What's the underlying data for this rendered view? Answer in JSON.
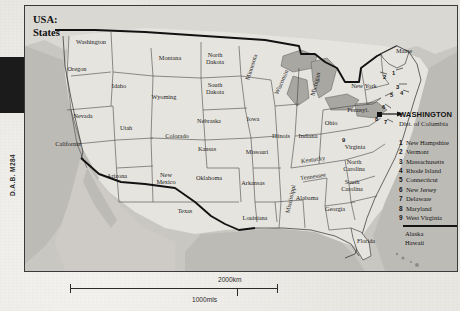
{
  "title": {
    "line1": "USA:",
    "line2": "States"
  },
  "reference_code": "D.A.B. M284",
  "capital": {
    "name": "WASHINGTON",
    "subtitle": "Dist. of Columbia"
  },
  "legend": {
    "entries": [
      {
        "num": "1",
        "name": "New Hampshire"
      },
      {
        "num": "2",
        "name": "Vermont"
      },
      {
        "num": "3",
        "name": "Massachusetts"
      },
      {
        "num": "4",
        "name": "Rhode Island"
      },
      {
        "num": "5",
        "name": "Connecticut"
      },
      {
        "num": "6",
        "name": "New Jersey"
      },
      {
        "num": "7",
        "name": "Delaware"
      },
      {
        "num": "8",
        "name": "Maryland"
      },
      {
        "num": "9",
        "name": "West Virginia"
      }
    ],
    "non_contiguous": [
      "Alaska",
      "Hawaii"
    ]
  },
  "scale": {
    "km": "2000km",
    "miles": "1000mls"
  },
  "map_labels": [
    {
      "name": "Washington",
      "x": 66,
      "y": 36,
      "rot": 0
    },
    {
      "name": "Oregon",
      "x": 52,
      "y": 63,
      "rot": 0
    },
    {
      "name": "Idaho",
      "x": 94,
      "y": 80,
      "rot": 0
    },
    {
      "name": "Montana",
      "x": 145,
      "y": 52,
      "rot": 0
    },
    {
      "name": "Wyoming",
      "x": 139,
      "y": 91,
      "rot": 0
    },
    {
      "name": "Nevada",
      "x": 58,
      "y": 110,
      "rot": 0
    },
    {
      "name": "Utah",
      "x": 101,
      "y": 122,
      "rot": 0
    },
    {
      "name": "Colorado",
      "x": 152,
      "y": 130,
      "rot": 0
    },
    {
      "name": "California",
      "x": 43,
      "y": 138,
      "rot": 0
    },
    {
      "name": "Arizona",
      "x": 92,
      "y": 170,
      "rot": 0
    },
    {
      "name": "New Mexico",
      "x": 141,
      "y": 173,
      "rot": 0
    },
    {
      "name": "Texas",
      "x": 160,
      "y": 205,
      "rot": 0
    },
    {
      "name": "Oklahoma",
      "x": 184,
      "y": 172,
      "rot": 0
    },
    {
      "name": "Kansas",
      "x": 182,
      "y": 143,
      "rot": 0
    },
    {
      "name": "Nebraska",
      "x": 184,
      "y": 115,
      "rot": 0
    },
    {
      "name": "North Dakota",
      "x": 190,
      "y": 53,
      "rot": 0
    },
    {
      "name": "South Dakota",
      "x": 190,
      "y": 83,
      "rot": 0
    },
    {
      "name": "Minnesota",
      "x": 226,
      "y": 61,
      "rot": -72
    },
    {
      "name": "Iowa",
      "x": 228,
      "y": 113,
      "rot": 0
    },
    {
      "name": "Missouri",
      "x": 232,
      "y": 146,
      "rot": 0
    },
    {
      "name": "Arkansas",
      "x": 228,
      "y": 177,
      "rot": 0
    },
    {
      "name": "Louisiana",
      "x": 230,
      "y": 212,
      "rot": 0
    },
    {
      "name": "Wisconsin",
      "x": 256,
      "y": 76,
      "rot": -66
    },
    {
      "name": "Illinois",
      "x": 256,
      "y": 130,
      "rot": 0
    },
    {
      "name": "Michigan",
      "x": 290,
      "y": 78,
      "rot": -76
    },
    {
      "name": "Indiana",
      "x": 283,
      "y": 130,
      "rot": 0
    },
    {
      "name": "Ohio",
      "x": 306,
      "y": 117,
      "rot": 0
    },
    {
      "name": "Kentucky",
      "x": 288,
      "y": 153,
      "rot": -8
    },
    {
      "name": "Tennessee",
      "x": 288,
      "y": 170,
      "rot": -8
    },
    {
      "name": "Mississippi",
      "x": 265,
      "y": 193,
      "rot": -78
    },
    {
      "name": "Alabama",
      "x": 282,
      "y": 192,
      "rot": 0
    },
    {
      "name": "Georgia",
      "x": 310,
      "y": 203,
      "rot": 0
    },
    {
      "name": "Florida",
      "x": 341,
      "y": 235,
      "rot": 0
    },
    {
      "name": "South Carolina",
      "x": 327,
      "y": 180,
      "rot": 0
    },
    {
      "name": "North Carolina",
      "x": 329,
      "y": 160,
      "rot": 0
    },
    {
      "name": "Virginia",
      "x": 330,
      "y": 141,
      "rot": 0
    },
    {
      "name": "Pennsyl.",
      "x": 333,
      "y": 104,
      "rot": 0
    },
    {
      "name": "New York",
      "x": 339,
      "y": 80,
      "rot": 0
    },
    {
      "name": "Maine",
      "x": 379,
      "y": 45,
      "rot": 0
    }
  ],
  "map_markers": [
    {
      "num": "1",
      "x": 367,
      "y": 64
    },
    {
      "num": "2",
      "x": 358,
      "y": 68
    },
    {
      "num": "3",
      "x": 371,
      "y": 78
    },
    {
      "num": "4",
      "x": 375,
      "y": 84
    },
    {
      "num": "5",
      "x": 365,
      "y": 86
    },
    {
      "num": "6",
      "x": 357,
      "y": 98
    },
    {
      "num": "7",
      "x": 359,
      "y": 113
    },
    {
      "num": "8",
      "x": 350,
      "y": 110
    },
    {
      "num": "9",
      "x": 317,
      "y": 131
    }
  ],
  "colors": {
    "land": "#e4e2dd",
    "water": "#b8b6b1",
    "border": "#1c1c1c",
    "paper": "#e9e7e2"
  }
}
